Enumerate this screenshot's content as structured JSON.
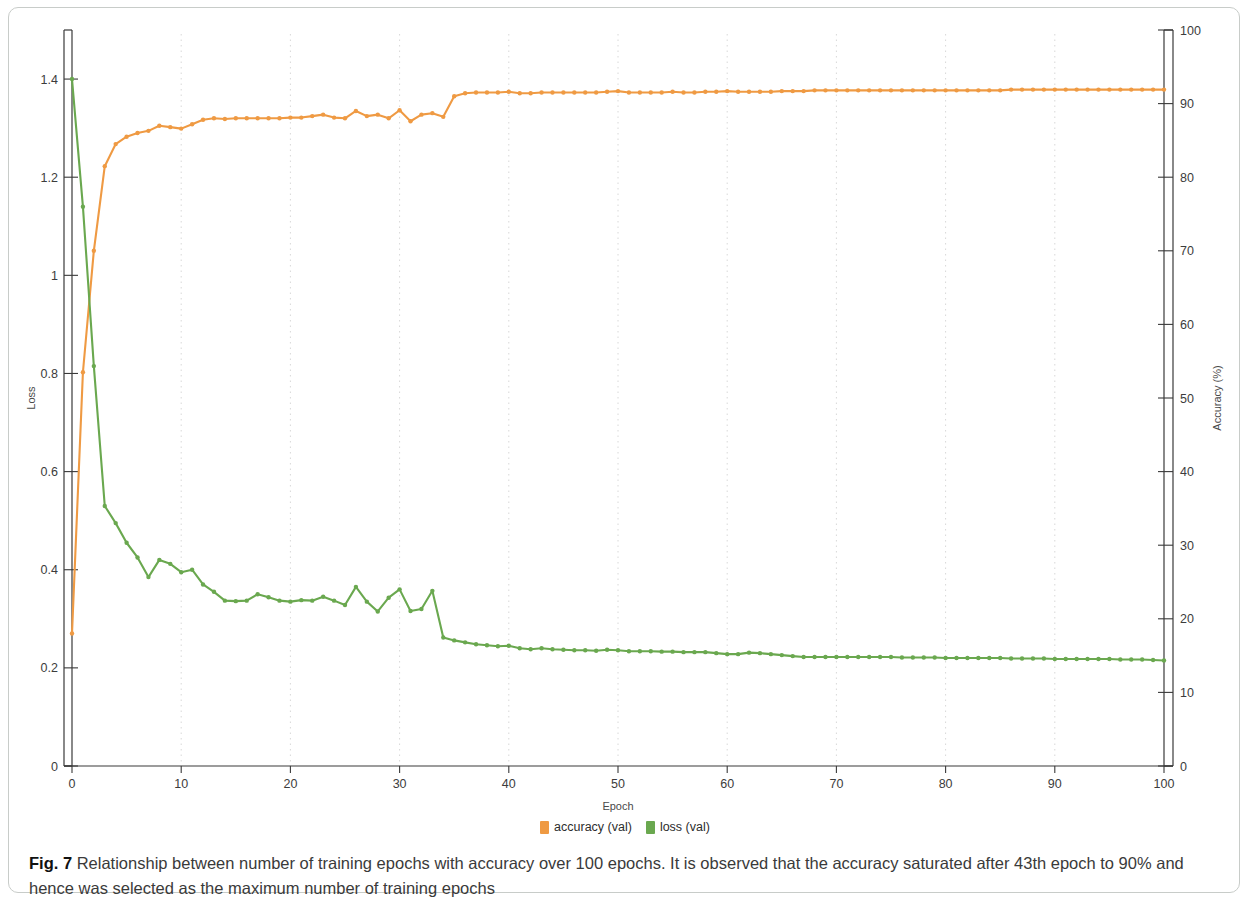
{
  "figure": {
    "caption_label": "Fig. 7",
    "caption_text": " Relationship between number of training epochs with accuracy over 100 epochs. It is observed that the accuracy saturated after 43th epoch to 90% and hence was selected as the maximum number of training epochs"
  },
  "legend": {
    "position": "bottom-center",
    "items": [
      {
        "label": "accuracy (val)",
        "color": "#ef9a43"
      },
      {
        "label": "loss (val)",
        "color": "#6aa84f"
      }
    ]
  },
  "chart_data": {
    "type": "line",
    "title": "",
    "xlabel": "Epoch",
    "ylabel": "Loss",
    "y2label": "Accuracy (%)",
    "xlim": [
      0,
      100
    ],
    "ylim": [
      0,
      1.5
    ],
    "y2lim": [
      0,
      100
    ],
    "xticks": [
      0,
      10,
      20,
      30,
      40,
      50,
      60,
      70,
      80,
      90,
      100
    ],
    "xticklabels": [
      "0",
      "10",
      "20",
      "30",
      "40",
      "50",
      "60",
      "70",
      "80",
      "90",
      "100"
    ],
    "yticks": [
      0,
      0.2,
      0.4,
      0.6,
      0.8,
      1,
      1.2,
      1.4
    ],
    "yticklabels": [
      "0",
      "0.2",
      "0.4",
      "0.6",
      "0.8",
      "1",
      "1.2",
      "1.4"
    ],
    "y2ticks": [
      0,
      10,
      20,
      30,
      40,
      50,
      60,
      70,
      80,
      90,
      100
    ],
    "y2ticklabels": [
      "0",
      "10",
      "20",
      "30",
      "40",
      "50",
      "60",
      "70",
      "80",
      "90",
      "100"
    ],
    "grid": "vertical-dotted",
    "x": [
      0,
      1,
      2,
      3,
      4,
      5,
      6,
      7,
      8,
      9,
      10,
      11,
      12,
      13,
      14,
      15,
      16,
      17,
      18,
      19,
      20,
      21,
      22,
      23,
      24,
      25,
      26,
      27,
      28,
      29,
      30,
      31,
      32,
      33,
      34,
      35,
      36,
      37,
      38,
      39,
      40,
      41,
      42,
      43,
      44,
      45,
      46,
      47,
      48,
      49,
      50,
      51,
      52,
      53,
      54,
      55,
      56,
      57,
      58,
      59,
      60,
      61,
      62,
      63,
      64,
      65,
      66,
      67,
      68,
      69,
      70,
      71,
      72,
      73,
      74,
      75,
      76,
      77,
      78,
      79,
      80,
      81,
      82,
      83,
      84,
      85,
      86,
      87,
      88,
      89,
      90,
      91,
      92,
      93,
      94,
      95,
      96,
      97,
      98,
      99,
      100
    ],
    "series": [
      {
        "name": "accuracy (val)",
        "axis": "right",
        "unit": "%",
        "color": "#ef9a43",
        "values": [
          18.0,
          53.5,
          70.0,
          81.5,
          84.5,
          85.5,
          86.0,
          86.3,
          87.0,
          86.8,
          86.6,
          87.2,
          87.8,
          88.0,
          87.9,
          88.0,
          88.0,
          88.0,
          88.0,
          88.0,
          88.1,
          88.1,
          88.3,
          88.5,
          88.1,
          88.0,
          89.0,
          88.3,
          88.5,
          88.0,
          89.1,
          87.6,
          88.5,
          88.7,
          88.2,
          91.0,
          91.4,
          91.5,
          91.5,
          91.5,
          91.6,
          91.4,
          91.4,
          91.5,
          91.5,
          91.5,
          91.5,
          91.5,
          91.5,
          91.6,
          91.7,
          91.5,
          91.5,
          91.5,
          91.5,
          91.6,
          91.5,
          91.5,
          91.6,
          91.6,
          91.7,
          91.6,
          91.6,
          91.6,
          91.6,
          91.7,
          91.7,
          91.7,
          91.8,
          91.8,
          91.8,
          91.8,
          91.8,
          91.8,
          91.8,
          91.8,
          91.8,
          91.8,
          91.8,
          91.8,
          91.8,
          91.8,
          91.8,
          91.8,
          91.8,
          91.8,
          91.9,
          91.9,
          91.9,
          91.9,
          91.9,
          91.9,
          91.9,
          91.9,
          91.9,
          91.9,
          91.9,
          91.9,
          91.9,
          91.9,
          91.9
        ]
      },
      {
        "name": "loss (val)",
        "axis": "left",
        "unit": "",
        "color": "#6aa84f",
        "values": [
          1.4,
          1.14,
          0.815,
          0.53,
          0.495,
          0.455,
          0.425,
          0.385,
          0.42,
          0.412,
          0.395,
          0.4,
          0.37,
          0.355,
          0.337,
          0.336,
          0.337,
          0.35,
          0.344,
          0.337,
          0.335,
          0.338,
          0.337,
          0.345,
          0.337,
          0.328,
          0.365,
          0.335,
          0.315,
          0.343,
          0.36,
          0.316,
          0.32,
          0.357,
          0.262,
          0.256,
          0.252,
          0.248,
          0.246,
          0.244,
          0.245,
          0.24,
          0.238,
          0.24,
          0.238,
          0.237,
          0.236,
          0.236,
          0.235,
          0.237,
          0.236,
          0.234,
          0.234,
          0.234,
          0.233,
          0.233,
          0.232,
          0.232,
          0.232,
          0.23,
          0.228,
          0.228,
          0.231,
          0.23,
          0.228,
          0.226,
          0.224,
          0.222,
          0.222,
          0.222,
          0.222,
          0.222,
          0.222,
          0.222,
          0.222,
          0.222,
          0.221,
          0.221,
          0.221,
          0.221,
          0.22,
          0.22,
          0.22,
          0.22,
          0.22,
          0.22,
          0.219,
          0.219,
          0.219,
          0.219,
          0.218,
          0.218,
          0.218,
          0.218,
          0.218,
          0.218,
          0.217,
          0.217,
          0.217,
          0.216,
          0.215
        ]
      }
    ]
  }
}
